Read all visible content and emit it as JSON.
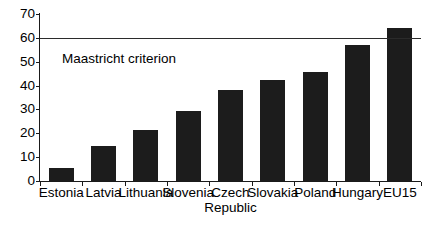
{
  "chart_data": {
    "type": "bar",
    "title": "",
    "subtitle": "",
    "xlabel": "",
    "ylabel": "",
    "ylim": [
      0,
      70
    ],
    "ytick_step": 10,
    "yticks": [
      0,
      10,
      20,
      30,
      40,
      50,
      60,
      70
    ],
    "ytick_labels": [
      "0",
      "10",
      "20",
      "30",
      "40",
      "50",
      "60",
      "70"
    ],
    "grid": false,
    "legend": "none",
    "bar_color": "#1c1c1c",
    "axis_color": "#1a1a1a",
    "categories": [
      "Estonia",
      "Latvia",
      "Lithuania",
      "Slovenia",
      "Czech Republic",
      "Slovakia",
      "Poland",
      "Hungary",
      "EU15"
    ],
    "category_label_lines": [
      [
        "Estonia"
      ],
      [
        "Latvia"
      ],
      [
        "Lithuania"
      ],
      [
        "Slovenia"
      ],
      [
        "Czech",
        "Republic"
      ],
      [
        "Slovakia"
      ],
      [
        "Poland"
      ],
      [
        "Hungary"
      ],
      [
        "EU15"
      ]
    ],
    "values": [
      5.5,
      14.5,
      21.5,
      29.5,
      38,
      42.5,
      45.5,
      57,
      64
    ],
    "annotations": [
      {
        "name": "maastricht-criterion",
        "label": "Maastricht criterion",
        "type": "hline",
        "value": 60,
        "color": "#2b2b2b"
      }
    ]
  }
}
